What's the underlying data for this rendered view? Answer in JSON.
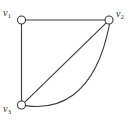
{
  "figure": {
    "type": "undirected-multigraph",
    "background_color": "#ffffff",
    "stroke_color": "#3a3a3a",
    "node_fill_color": "#ffffff",
    "label_color": "#2b2b2b"
  },
  "vertices": [
    {
      "id": "v1",
      "name": "v",
      "subscript": "1",
      "x": 21.5,
      "y": 20.0,
      "radius": 4.0,
      "label_position": "top-left"
    },
    {
      "id": "v2",
      "name": "v",
      "subscript": "2",
      "x": 109.0,
      "y": 20.0,
      "radius": 4.0,
      "label_position": "top-right"
    },
    {
      "id": "v3",
      "name": "v",
      "subscript": "3",
      "x": 21.5,
      "y": 105.0,
      "radius": 4.0,
      "label_position": "bottom-left"
    }
  ],
  "edges": [
    {
      "id": "e1",
      "from": "v1",
      "to": "v2",
      "shape": "straight",
      "orientation": "horizontal"
    },
    {
      "id": "e2",
      "from": "v1",
      "to": "v3",
      "shape": "straight",
      "orientation": "vertical"
    },
    {
      "id": "e3",
      "from": "v3",
      "to": "v2",
      "shape": "straight",
      "orientation": "diagonal"
    },
    {
      "id": "e4",
      "from": "v3",
      "to": "v2",
      "shape": "curved-arc",
      "orientation": "bulging-right-down"
    }
  ],
  "counts": {
    "vertices": 3,
    "edges": 4
  }
}
